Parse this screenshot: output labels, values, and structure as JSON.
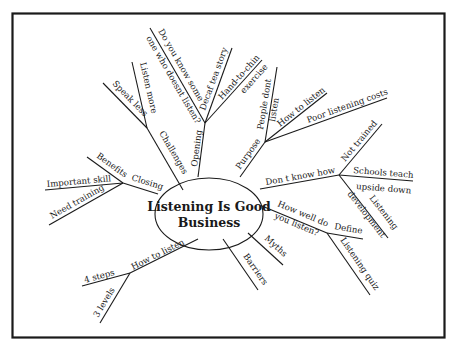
{
  "diagram": {
    "type": "mind-map",
    "central_topic": {
      "line1": "Listening Is Good",
      "line2": "Business"
    },
    "colors": {
      "ink": "#1a1a1a",
      "background": "#ffffff",
      "frame": "#1a1a1a"
    },
    "branches": {
      "opening": {
        "label": "Opening",
        "children": {
          "do_you_know_a": "Do you know some",
          "do_you_know_b": "one who doesnt listen?",
          "decaf": "Decaf tea story",
          "hand_a": "Hand-to-chin",
          "hand_b": "exercise"
        }
      },
      "challenges": {
        "label": "Challenges",
        "children": {
          "speak_less": "Speak less",
          "listen_more": "Listen more"
        }
      },
      "purpose": {
        "label": "Purpose",
        "children": {
          "people_a": "People dont",
          "people_b": "listen",
          "how_to_listen": "How to listen",
          "poor_costs": "Poor listening costs"
        }
      },
      "dont_know_how": {
        "label": "Don t know how",
        "children": {
          "not_trained": "Not trained",
          "schools_a": "Schools teach",
          "schools_b": "upside down",
          "dev_a": "Listening",
          "dev_b": "development"
        }
      },
      "how_well": {
        "label_a": "How well do",
        "label_b": "you listen?",
        "children": {
          "define": "Define",
          "quiz": "Listening quiz"
        }
      },
      "myths": {
        "label": "Myths"
      },
      "barriers": {
        "label": "Barriers"
      },
      "how_to_listen": {
        "label": "How to listen",
        "children": {
          "four_steps": "4 steps",
          "three_levels": "3 levels"
        }
      },
      "closing": {
        "label": "Closing",
        "children": {
          "benefits": "Benefits",
          "important_skill": "Important skill",
          "need_training": "Need training"
        }
      }
    }
  }
}
